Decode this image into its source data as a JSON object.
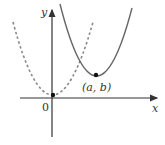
{
  "diagram": {
    "axes": {
      "x_label": "x",
      "y_label": "y",
      "origin_label": "0",
      "color": "#333333"
    },
    "curves": [
      {
        "name": "base-parabola",
        "style": "dashed",
        "color": "#888888",
        "vertex": "origin"
      },
      {
        "name": "shifted-parabola",
        "style": "solid",
        "color": "#666666",
        "vertex": "(a, b)"
      }
    ],
    "points": [
      {
        "name": "origin-point",
        "label": ""
      },
      {
        "name": "vertex-point",
        "label": "(a, b)"
      }
    ]
  }
}
